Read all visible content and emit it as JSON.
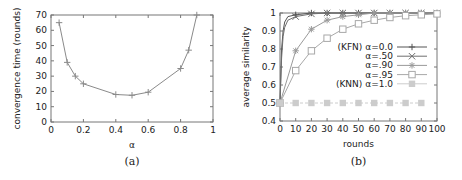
{
  "chart_data": [
    {
      "type": "line",
      "caption": "(a)",
      "title": "",
      "xlabel": "α",
      "ylabel": "convergence time (rounds)",
      "xlim": [
        0,
        1
      ],
      "ylim": [
        0,
        70
      ],
      "xticks": [
        "0",
        "0.2",
        "0.4",
        "0.6",
        "0.8",
        "1"
      ],
      "yticks": [
        "0",
        "10",
        "20",
        "30",
        "40",
        "50",
        "60",
        "70"
      ],
      "grid": false,
      "legend": null,
      "series": [
        {
          "name": "convergence time",
          "marker": "plus",
          "color": "#8a8a8a",
          "x": [
            0.05,
            0.1,
            0.15,
            0.2,
            0.4,
            0.5,
            0.6,
            0.8,
            0.85,
            0.9
          ],
          "y": [
            65,
            39,
            30,
            25,
            18,
            17.5,
            19.5,
            35,
            47,
            70
          ]
        }
      ]
    },
    {
      "type": "line",
      "caption": "(b)",
      "title": "",
      "xlabel": "rounds",
      "ylabel": "average similarity",
      "xlim": [
        0,
        100
      ],
      "ylim": [
        0.4,
        1.0
      ],
      "xticks": [
        "0",
        "10",
        "20",
        "30",
        "40",
        "50",
        "60",
        "70",
        "80",
        "90",
        "100"
      ],
      "yticks": [
        "0.4",
        "0.5",
        "0.6",
        "0.7",
        "0.8",
        "0.9",
        "1"
      ],
      "grid": false,
      "legend_position": "right-inside",
      "series": [
        {
          "name": "(KFN) α=0.0",
          "marker": "plus",
          "color": "#555555",
          "x": [
            0,
            1,
            2,
            3,
            5,
            10,
            20,
            30,
            40,
            50,
            60,
            70,
            80,
            90,
            100
          ],
          "y": [
            0.5,
            0.8,
            0.9,
            0.95,
            0.98,
            0.99,
            1.0,
            1.0,
            1.0,
            1.0,
            1.0,
            1.0,
            1.0,
            1.0,
            1.0
          ]
        },
        {
          "name": "α=.50",
          "marker": "x",
          "color": "#6e6e6e",
          "x": [
            0,
            1,
            2,
            3,
            5,
            10,
            20,
            30,
            40,
            50,
            60,
            70,
            80,
            90,
            100
          ],
          "y": [
            0.5,
            0.75,
            0.87,
            0.92,
            0.96,
            0.98,
            0.995,
            1.0,
            1.0,
            1.0,
            1.0,
            1.0,
            1.0,
            1.0,
            1.0
          ]
        },
        {
          "name": "α=.90",
          "marker": "asterisk",
          "color": "#9a9a9a",
          "x": [
            0,
            10,
            20,
            30,
            40,
            50,
            60,
            70,
            80,
            90,
            100
          ],
          "y": [
            0.5,
            0.79,
            0.91,
            0.96,
            0.98,
            0.99,
            1.0,
            1.0,
            1.0,
            1.0,
            1.0
          ]
        },
        {
          "name": "α=.95",
          "marker": "open-square",
          "color": "#a8a8a8",
          "x": [
            0,
            10,
            20,
            30,
            40,
            50,
            60,
            70,
            80,
            90,
            100
          ],
          "y": [
            0.5,
            0.68,
            0.79,
            0.86,
            0.91,
            0.94,
            0.96,
            0.975,
            0.985,
            0.99,
            0.995
          ]
        },
        {
          "name": "(KNN) α=1.0",
          "marker": "filled-square",
          "color": "#cccccc",
          "x": [
            0,
            10,
            20,
            30,
            40,
            50,
            60,
            70,
            80,
            90
          ],
          "y": [
            0.5,
            0.5,
            0.5,
            0.5,
            0.5,
            0.5,
            0.5,
            0.5,
            0.5,
            0.5
          ]
        }
      ]
    }
  ]
}
